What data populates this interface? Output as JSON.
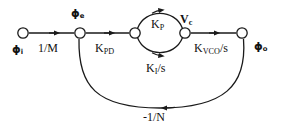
{
  "diagram": {
    "type": "signal-flow-graph",
    "nodes": [
      {
        "id": "phi_i",
        "label_base": "ϕ",
        "label_sub": "i",
        "x": 23,
        "y": 33
      },
      {
        "id": "phi_e",
        "label_base": "ϕ",
        "label_sub": "e",
        "x": 80,
        "y": 33
      },
      {
        "id": "split",
        "label_base": "",
        "label_sub": "",
        "x": 135,
        "y": 33
      },
      {
        "id": "v_c",
        "label_base": "V",
        "label_sub": "c",
        "x": 185,
        "y": 33
      },
      {
        "id": "phi_o",
        "label_base": "ϕ",
        "label_sub": "o",
        "x": 242,
        "y": 33
      }
    ],
    "edges": [
      {
        "id": "e1",
        "from": "phi_i",
        "to": "phi_e",
        "gain_base": "1/M",
        "gain_sub": ""
      },
      {
        "id": "e2",
        "from": "phi_e",
        "to": "split",
        "gain_base": "K",
        "gain_sub": "PD"
      },
      {
        "id": "e3",
        "from": "split",
        "to": "v_c",
        "gain_base": "K",
        "gain_sub": "P"
      },
      {
        "id": "e4",
        "from": "split",
        "to": "v_c",
        "gain_base": "K",
        "gain_sub": "I",
        "gain_tail": "/s"
      },
      {
        "id": "e5",
        "from": "v_c",
        "to": "phi_o",
        "gain_base": "K",
        "gain_sub": "VCO",
        "gain_tail": "/s"
      },
      {
        "id": "e6",
        "from": "phi_o",
        "to": "phi_e",
        "gain_base": "-1/N",
        "gain_sub": ""
      }
    ],
    "labels": {
      "phi_i": {
        "base": "ϕ",
        "sub": "i"
      },
      "phi_e": {
        "base": "ϕ",
        "sub": "e"
      },
      "phi_o": {
        "base": "ϕ",
        "sub": "o"
      },
      "v_c": {
        "base": "V",
        "sub": "c"
      },
      "one_over_m": {
        "base": "1/M",
        "sub": "",
        "tail": ""
      },
      "k_pd": {
        "base": "K",
        "sub": "PD",
        "tail": ""
      },
      "k_p": {
        "base": "K",
        "sub": "P",
        "tail": ""
      },
      "k_i_s": {
        "base": "K",
        "sub": "I",
        "tail": "/s"
      },
      "k_vco_s": {
        "base": "K",
        "sub": "VCO",
        "tail": "/s"
      },
      "minus_one_over_n": {
        "base": "-1/N",
        "sub": "",
        "tail": ""
      }
    },
    "colors": {
      "line": "#1a1a1a",
      "node_fill": "#ffffff",
      "node_stroke": "#1a1a1a",
      "text": "#111111",
      "background": "#ffffff"
    }
  }
}
